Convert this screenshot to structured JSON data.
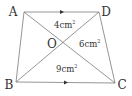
{
  "diagram": {
    "type": "trapezoid-with-diagonals",
    "vertices": {
      "A": {
        "label": "A",
        "x": 24,
        "y": 12
      },
      "B": {
        "label": "B",
        "x": 16,
        "y": 82
      },
      "C": {
        "label": "C",
        "x": 115,
        "y": 83
      },
      "D": {
        "label": "D",
        "x": 99,
        "y": 12
      }
    },
    "intersection": {
      "label": "O",
      "x": 63,
      "y": 43
    },
    "areas": {
      "AOD": "4cm",
      "DOC": "6cm",
      "BOC": "9cm"
    },
    "area_unit_superscript": "2",
    "parallel_sides": [
      "AD",
      "BC"
    ],
    "colors": {
      "line": "#7a7a7a",
      "text": "#333333"
    }
  }
}
